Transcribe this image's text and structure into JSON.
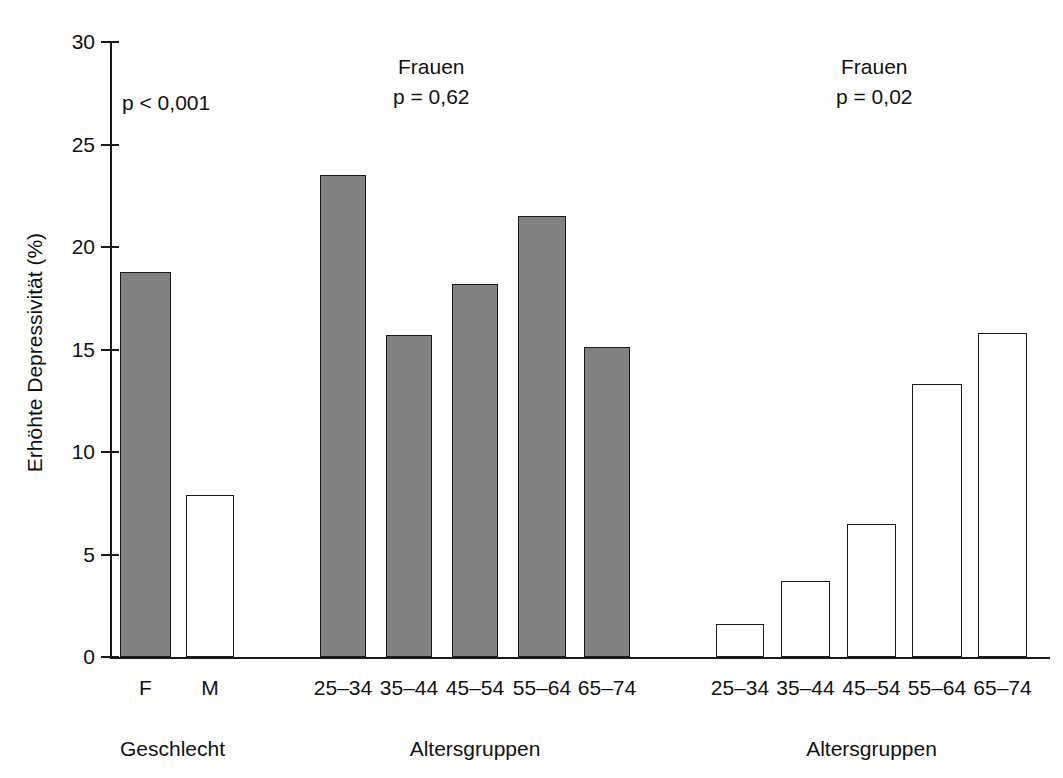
{
  "chart_data": {
    "type": "bar",
    "title": "",
    "subtitle": "",
    "xlabel": "",
    "ylabel": "Erhöhte Depressivität (%)",
    "ylim": [
      0,
      30
    ],
    "yticks": [
      0,
      5,
      10,
      15,
      20,
      25,
      30
    ],
    "ytick_labels": [
      "0",
      "5",
      "10",
      "15",
      "20",
      "25",
      "30"
    ],
    "grid": false,
    "legend": "none",
    "groups": [
      {
        "name": "Geschlecht",
        "group_label": "Geschlecht",
        "annotation_title": "",
        "annotation_p": "p < 0,001",
        "fill": "mixed",
        "categories": [
          "F",
          "M"
        ],
        "values": [
          18.8,
          7.9
        ],
        "bar_styles": [
          "filled",
          "open"
        ]
      },
      {
        "name": "Altersgruppen Frauen",
        "group_label": "Altersgruppen",
        "annotation_title": "Frauen",
        "annotation_p": "p = 0,62",
        "fill": "filled",
        "categories": [
          "25–34",
          "35–44",
          "45–54",
          "55–64",
          "65–74"
        ],
        "values": [
          23.5,
          15.7,
          18.2,
          21.5,
          15.1
        ],
        "bar_styles": [
          "filled",
          "filled",
          "filled",
          "filled",
          "filled"
        ]
      },
      {
        "name": "Altersgruppen Männer",
        "group_label": "Altersgruppen",
        "annotation_title": "Frauen",
        "annotation_p": "p = 0,02",
        "fill": "open",
        "categories": [
          "25–34",
          "35–44",
          "45–54",
          "55–64",
          "65–74"
        ],
        "values": [
          1.6,
          3.7,
          6.5,
          13.3,
          15.8
        ],
        "bar_styles": [
          "open",
          "open",
          "open",
          "open",
          "open"
        ]
      }
    ],
    "colors": {
      "filled_bar": "#808080",
      "open_bar": "#ffffff",
      "bar_outline": "#1a1a1a",
      "axis": "#1a1a1a",
      "text": "#111111"
    }
  },
  "layout": {
    "axis_top_px": 42,
    "axis_bottom_px": 657,
    "axis_left_px": 110,
    "px_per_unit": 20.5,
    "bar_positions": [
      {
        "left": 120,
        "width": 51
      },
      {
        "left": 186,
        "width": 48
      },
      {
        "left": 320,
        "width": 46
      },
      {
        "left": 386,
        "width": 46
      },
      {
        "left": 452,
        "width": 46
      },
      {
        "left": 518,
        "width": 48
      },
      {
        "left": 584,
        "width": 46
      },
      {
        "left": 716,
        "width": 48
      },
      {
        "left": 781,
        "width": 49
      },
      {
        "left": 847,
        "width": 49
      },
      {
        "left": 912,
        "width": 50
      },
      {
        "left": 978,
        "width": 49
      }
    ],
    "annotation_positions": [
      {
        "left": 122,
        "top": 88
      },
      {
        "left": 393,
        "top": 52
      },
      {
        "left": 836,
        "top": 52
      }
    ],
    "group_label_positions": [
      {
        "left": 110,
        "width": 125
      },
      {
        "left": 320,
        "width": 310
      },
      {
        "left": 716,
        "width": 311
      }
    ]
  }
}
